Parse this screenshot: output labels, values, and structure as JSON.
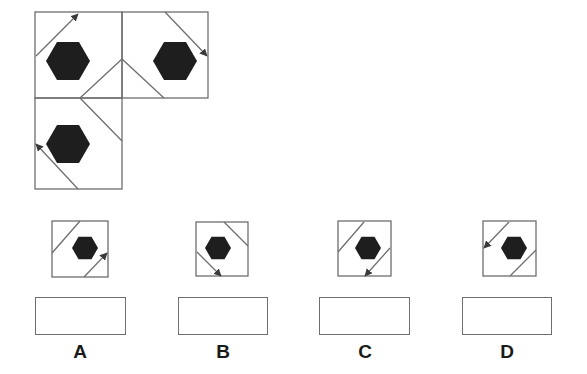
{
  "colors": {
    "stroke": "#6e6e6e",
    "hexagon": "#1e1e1e",
    "arrow": "#3a3a3a",
    "background": "#ffffff",
    "label": "#1a1a1a"
  },
  "question_figure": {
    "description": "L-shaped arrangement of three squares, each with a black hexagon and a diagonal arrow; fold lines connect the cells",
    "cells": [
      {
        "id": "top-left",
        "box": [
          35,
          12,
          87,
          86
        ],
        "hexagon": {
          "cx": 68,
          "cy": 61,
          "r": 22
        },
        "arrow": {
          "x1": 36,
          "y1": 56,
          "x2": 78,
          "y2": 14,
          "head": "end"
        }
      },
      {
        "id": "top-right",
        "box": [
          122,
          12,
          86,
          86
        ],
        "hexagon": {
          "cx": 175,
          "cy": 61,
          "r": 22
        },
        "arrow": {
          "x1": 165,
          "y1": 12,
          "x2": 207,
          "y2": 56,
          "head": "end"
        }
      },
      {
        "id": "bottom-left",
        "box": [
          35,
          98,
          87,
          91
        ],
        "hexagon": {
          "cx": 68,
          "cy": 144,
          "r": 22
        },
        "arrow": {
          "x1": 78,
          "y1": 189,
          "x2": 36,
          "y2": 144,
          "head": "end"
        }
      }
    ],
    "fold_lines": [
      {
        "x1": 80,
        "y1": 98,
        "x2": 122,
        "y2": 59
      },
      {
        "x1": 122,
        "y1": 59,
        "x2": 164,
        "y2": 98
      },
      {
        "x1": 80,
        "y1": 98,
        "x2": 122,
        "y2": 141
      }
    ]
  },
  "options": [
    {
      "letter": "A",
      "box": [
        52,
        221,
        56,
        56
      ],
      "hexagon": {
        "cx": 85,
        "cy": 248,
        "r": 13
      },
      "lines": [
        {
          "x1": 52,
          "y1": 253,
          "x2": 80,
          "y2": 221,
          "head": "none"
        },
        {
          "x1": 84,
          "y1": 277,
          "x2": 107,
          "y2": 253,
          "head": "end"
        }
      ],
      "answer_box": [
        35,
        297,
        91,
        38
      ],
      "label_pos": [
        60,
        342
      ]
    },
    {
      "letter": "B",
      "box": [
        196,
        222,
        52,
        54
      ],
      "hexagon": {
        "cx": 218,
        "cy": 248,
        "r": 13
      },
      "lines": [
        {
          "x1": 224,
          "y1": 222,
          "x2": 248,
          "y2": 246,
          "head": "none"
        },
        {
          "x1": 197,
          "y1": 252,
          "x2": 221,
          "y2": 276,
          "head": "end"
        }
      ],
      "answer_box": [
        178,
        297,
        90,
        38
      ],
      "label_pos": [
        203,
        342
      ]
    },
    {
      "letter": "C",
      "box": [
        338,
        221,
        53,
        55
      ],
      "hexagon": {
        "cx": 368,
        "cy": 248,
        "r": 13
      },
      "lines": [
        {
          "x1": 338,
          "y1": 252,
          "x2": 364,
          "y2": 222,
          "head": "none"
        },
        {
          "x1": 390,
          "y1": 248,
          "x2": 365,
          "y2": 276,
          "head": "end"
        }
      ],
      "answer_box": [
        319,
        297,
        91,
        38
      ],
      "label_pos": [
        345,
        342
      ]
    },
    {
      "letter": "D",
      "box": [
        483,
        221,
        53,
        55
      ],
      "hexagon": {
        "cx": 514,
        "cy": 248,
        "r": 13
      },
      "lines": [
        {
          "x1": 509,
          "y1": 222,
          "x2": 484,
          "y2": 248,
          "head": "end"
        },
        {
          "x1": 510,
          "y1": 276,
          "x2": 536,
          "y2": 250,
          "head": "none"
        }
      ],
      "answer_box": [
        462,
        297,
        90,
        38
      ],
      "label_pos": [
        487,
        342
      ]
    }
  ]
}
